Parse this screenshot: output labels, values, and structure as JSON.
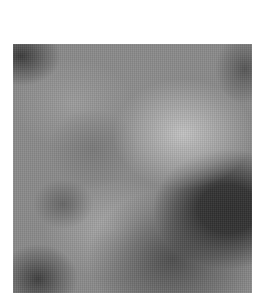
{
  "image": {
    "kind": "grayscale-noise-texture",
    "colors": {
      "background": "#ffffff",
      "base": "#8a8a8a",
      "highlight": "#c2c2c2",
      "shadow": "#2e2e2e"
    }
  }
}
